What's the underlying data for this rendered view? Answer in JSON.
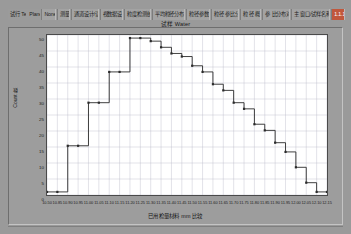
{
  "window": {
    "title": "试样 Water"
  },
  "menubar": {
    "items": [
      {
        "label": "试行 Test",
        "style": "plain"
      },
      {
        "label": "Plane",
        "style": "plain"
      },
      {
        "label": "None",
        "style": "cell"
      },
      {
        "label": "测量",
        "style": "cell"
      },
      {
        "label": "通道设计/读取",
        "style": "cell"
      },
      {
        "label": "视数据设置",
        "style": "cell"
      },
      {
        "label": "粒度检测统计",
        "style": "cell"
      },
      {
        "label": "平均粒径分布比较",
        "style": "cell"
      },
      {
        "label": "粒径参数图",
        "style": "cell"
      },
      {
        "label": "粒径 参比分布",
        "style": "cell"
      },
      {
        "label": "粒 径 概要",
        "style": "cell"
      },
      {
        "label": "参 比分布对照",
        "style": "cell"
      },
      {
        "label": "主 窗口/试样名称记录",
        "style": "cell"
      },
      {
        "label": "1.1.1",
        "style": "hl"
      }
    ]
  },
  "chart_data": {
    "type": "line",
    "title": "试样 Water",
    "xlabel": "已用检量材料 mm 比较",
    "ylabel": "Count 数",
    "xlim": [
      0,
      27
    ],
    "ylim": [
      0,
      52
    ],
    "grid": true,
    "legend": "none",
    "xticklabels": [
      "10.50",
      "10.85",
      "10.90",
      "10.95",
      "11.00",
      "11.05",
      "11.10",
      "11.15",
      "11.20",
      "11.25",
      "11.30",
      "11.35",
      "11.40",
      "11.45",
      "11.50",
      "11.55",
      "11.60",
      "11.65",
      "11.70",
      "11.75",
      "11.80",
      "11.85",
      "11.90",
      "11.95",
      "12.00",
      "12.05",
      "12.10",
      "12.15"
    ],
    "yticklabels": [
      "0",
      "5",
      "10",
      "15",
      "20",
      "25",
      "30",
      "35",
      "40",
      "45",
      "50"
    ],
    "series": [
      {
        "name": "Cumulative count",
        "x": [
          0,
          1,
          2,
          3,
          4,
          5,
          6,
          7,
          8,
          9,
          10,
          11,
          12,
          13,
          14,
          15,
          16,
          17,
          18,
          19,
          20,
          21,
          22,
          23,
          24,
          25,
          26,
          27
        ],
        "y": [
          1,
          1,
          16,
          16,
          30,
          30,
          40,
          40,
          51,
          51,
          50,
          48,
          46,
          45,
          42,
          40,
          36,
          34,
          30,
          28,
          23,
          21,
          17,
          14,
          9,
          4,
          1,
          1
        ]
      }
    ]
  },
  "statusbar": {
    "text": ""
  },
  "colors": {
    "accent": "#c1573c",
    "plot_bg": "#ffffff",
    "grid": "#b9b9c8",
    "line": "#2b2b2b",
    "panel_bg": "#9d9d9d",
    "app_bg": "#9a9a9a"
  }
}
